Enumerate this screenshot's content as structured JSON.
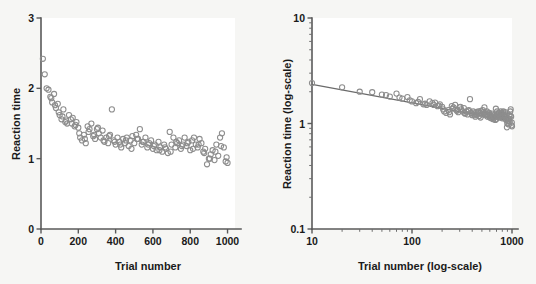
{
  "figure": {
    "background_color": "#f6f6f4",
    "panel_color": "#ffffff",
    "marker_color": "#8d8d8d",
    "axis_color": "#5a5a5a",
    "fit_line_color": "#6a6a6a"
  },
  "chart_data": [
    {
      "type": "scatter",
      "panel": "left",
      "title": "",
      "xlabel": "Trial number",
      "ylabel": "Reaction time",
      "xlim": [
        0,
        1040
      ],
      "ylim": [
        0,
        3
      ],
      "xticks": [
        0,
        200,
        400,
        600,
        800,
        1000
      ],
      "xticklabels": [
        "0",
        "200",
        "400",
        "600",
        "800",
        "1000"
      ],
      "yticks": [
        0,
        1,
        2,
        3
      ],
      "yticklabels": [
        "0",
        "1",
        "2",
        "3"
      ],
      "xscale": "linear",
      "yscale": "linear",
      "grid": false,
      "legend": null,
      "marker": "open-circle",
      "x": [
        10,
        20,
        30,
        40,
        50,
        60,
        70,
        80,
        90,
        100,
        110,
        120,
        130,
        140,
        150,
        160,
        170,
        180,
        190,
        200,
        210,
        220,
        230,
        240,
        250,
        260,
        270,
        280,
        290,
        300,
        310,
        320,
        330,
        340,
        350,
        360,
        370,
        380,
        390,
        400,
        410,
        420,
        430,
        440,
        450,
        460,
        470,
        480,
        490,
        500,
        510,
        520,
        530,
        540,
        550,
        560,
        570,
        580,
        590,
        600,
        610,
        620,
        630,
        640,
        650,
        660,
        670,
        680,
        690,
        700,
        710,
        720,
        730,
        740,
        750,
        760,
        770,
        780,
        790,
        800,
        810,
        820,
        830,
        840,
        850,
        860,
        870,
        880,
        890,
        900,
        910,
        920,
        930,
        940,
        950,
        960,
        970,
        980,
        990,
        1000,
        55,
        75,
        95,
        115,
        135,
        165,
        185,
        205,
        235,
        255,
        285,
        305,
        335,
        365,
        395,
        425,
        455,
        485,
        515,
        545,
        575,
        605,
        635,
        665,
        695,
        725,
        755,
        785,
        815,
        845,
        875,
        905,
        935,
        965,
        995
      ],
      "y": [
        2.42,
        2.2,
        2.0,
        1.98,
        1.88,
        1.8,
        1.92,
        1.72,
        1.78,
        1.62,
        1.56,
        1.7,
        1.52,
        1.5,
        1.62,
        1.56,
        1.58,
        1.46,
        1.52,
        1.44,
        1.3,
        1.26,
        1.34,
        1.22,
        1.46,
        1.42,
        1.5,
        1.32,
        1.28,
        1.42,
        1.36,
        1.3,
        1.4,
        1.24,
        1.3,
        1.22,
        1.34,
        1.7,
        1.26,
        1.2,
        1.3,
        1.24,
        1.16,
        1.28,
        1.22,
        1.3,
        1.18,
        1.26,
        1.32,
        1.22,
        1.34,
        1.28,
        1.42,
        1.2,
        1.24,
        1.3,
        1.16,
        1.22,
        1.26,
        1.14,
        1.2,
        1.12,
        1.24,
        1.16,
        1.1,
        1.2,
        1.14,
        1.08,
        1.38,
        1.2,
        1.3,
        1.16,
        1.22,
        1.26,
        1.14,
        1.2,
        1.3,
        1.18,
        1.24,
        1.12,
        1.26,
        1.3,
        1.2,
        1.16,
        1.28,
        1.22,
        1.1,
        1.14,
        0.92,
        1.0,
        1.06,
        1.12,
        0.98,
        1.2,
        1.04,
        1.3,
        1.36,
        1.16,
        0.96,
        0.94,
        1.86,
        1.76,
        1.66,
        1.6,
        1.54,
        1.5,
        1.48,
        1.36,
        1.28,
        1.38,
        1.34,
        1.44,
        1.26,
        1.32,
        1.24,
        1.2,
        1.26,
        1.14,
        1.28,
        1.24,
        1.2,
        1.18,
        1.12,
        1.16,
        1.1,
        1.24,
        1.18,
        1.22,
        1.14,
        1.2,
        1.08,
        1.0,
        1.1,
        1.18,
        1.02
      ]
    },
    {
      "type": "scatter",
      "panel": "right",
      "title": "",
      "xlabel": "Trial number (log-scale)",
      "ylabel": "Reaction time (log-scale)",
      "xlim": [
        10,
        1000
      ],
      "ylim": [
        0.1,
        10
      ],
      "xticks": [
        10,
        100,
        1000
      ],
      "xticklabels": [
        "10",
        "100",
        "1000"
      ],
      "yticks": [
        0.1,
        1,
        10
      ],
      "yticklabels": [
        "0.1",
        "1",
        "10"
      ],
      "xscale": "log",
      "yscale": "log",
      "grid": false,
      "legend": null,
      "marker": "open-circle",
      "fit_line": {
        "x": [
          10,
          1000
        ],
        "y": [
          2.35,
          1.05
        ],
        "label": "power-law fit"
      },
      "x": [
        10,
        20,
        30,
        40,
        50,
        60,
        70,
        80,
        90,
        100,
        110,
        120,
        130,
        140,
        150,
        160,
        170,
        180,
        190,
        200,
        210,
        220,
        230,
        240,
        250,
        260,
        270,
        280,
        290,
        300,
        310,
        320,
        330,
        340,
        350,
        360,
        370,
        380,
        390,
        400,
        410,
        420,
        430,
        440,
        450,
        460,
        470,
        480,
        490,
        500,
        510,
        520,
        530,
        540,
        550,
        560,
        570,
        580,
        590,
        600,
        610,
        620,
        630,
        640,
        650,
        660,
        670,
        680,
        690,
        700,
        710,
        720,
        730,
        740,
        750,
        760,
        770,
        780,
        790,
        800,
        810,
        820,
        830,
        840,
        850,
        860,
        870,
        880,
        890,
        900,
        910,
        920,
        930,
        940,
        950,
        960,
        970,
        980,
        990,
        1000,
        55,
        75,
        95,
        115,
        135,
        165,
        185,
        205,
        235,
        255,
        285,
        305,
        335,
        365,
        395,
        425,
        455,
        485,
        515,
        545,
        575,
        605,
        635,
        665,
        695,
        725,
        755,
        785,
        815,
        845,
        875,
        905,
        935,
        965,
        995
      ],
      "y": [
        2.42,
        2.2,
        2.0,
        1.98,
        1.88,
        1.8,
        1.92,
        1.72,
        1.78,
        1.62,
        1.56,
        1.7,
        1.52,
        1.5,
        1.62,
        1.56,
        1.58,
        1.46,
        1.52,
        1.44,
        1.3,
        1.26,
        1.34,
        1.22,
        1.46,
        1.42,
        1.5,
        1.32,
        1.28,
        1.42,
        1.36,
        1.3,
        1.4,
        1.24,
        1.3,
        1.22,
        1.34,
        1.7,
        1.26,
        1.2,
        1.3,
        1.24,
        1.16,
        1.28,
        1.22,
        1.3,
        1.18,
        1.26,
        1.32,
        1.22,
        1.34,
        1.28,
        1.42,
        1.2,
        1.24,
        1.3,
        1.16,
        1.22,
        1.26,
        1.14,
        1.2,
        1.12,
        1.24,
        1.16,
        1.1,
        1.2,
        1.14,
        1.08,
        1.38,
        1.2,
        1.3,
        1.16,
        1.22,
        1.26,
        1.14,
        1.2,
        1.3,
        1.18,
        1.24,
        1.12,
        1.26,
        1.3,
        1.2,
        1.16,
        1.28,
        1.22,
        1.1,
        1.14,
        0.92,
        1.0,
        1.06,
        1.12,
        0.98,
        1.2,
        1.04,
        1.3,
        1.36,
        1.16,
        0.96,
        0.94,
        1.86,
        1.76,
        1.66,
        1.6,
        1.54,
        1.5,
        1.48,
        1.36,
        1.28,
        1.38,
        1.34,
        1.44,
        1.26,
        1.32,
        1.24,
        1.2,
        1.26,
        1.14,
        1.28,
        1.24,
        1.2,
        1.18,
        1.12,
        1.16,
        1.1,
        1.24,
        1.18,
        1.22,
        1.14,
        1.2,
        1.08,
        1.0,
        1.1,
        1.18,
        1.02
      ]
    }
  ]
}
